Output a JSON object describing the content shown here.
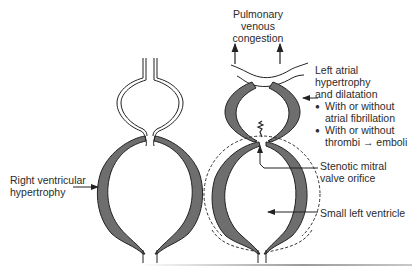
{
  "figure": {
    "left_panel": {
      "name": "normal-heart-with-rv-hypertrophy",
      "labels": {
        "right_ventricular_hypertrophy": [
          "Right ventricular",
          "hypertrophy"
        ]
      }
    },
    "right_panel": {
      "name": "mitral-stenosis-left-heart",
      "labels": {
        "pulmonary_venous_congestion": [
          "Pulmonary",
          "venous",
          "congestion"
        ],
        "left_atrial": [
          "Left atrial",
          "hypertrophy",
          "and dilatation"
        ],
        "bullets": [
          [
            "With or without",
            "atrial fibrillation"
          ],
          [
            "With or without",
            "thrombi → emboli"
          ]
        ],
        "stenotic_valve": [
          "Stenotic mitral",
          "valve orifice"
        ],
        "small_lv": "Small left ventricle"
      }
    },
    "colors": {
      "wall_fill": "#6e6e6e",
      "outline": "#222222",
      "background": "#ffffff",
      "dashed_outline": "#333333"
    }
  }
}
